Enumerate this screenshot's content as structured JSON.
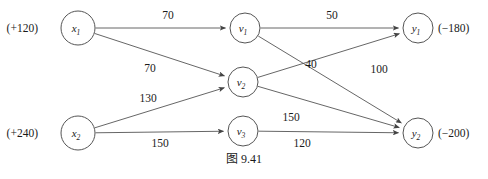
{
  "figure": {
    "caption": "图 9.41",
    "caption_x": 244,
    "caption_y": 163
  },
  "chart_data": {
    "type": "diagram",
    "title": "图 9.41",
    "nodes": [
      {
        "id": "x1",
        "label": "x",
        "sub": "1",
        "cx": 78,
        "cy": 28,
        "r": 17,
        "supply": "(+120)",
        "supply_x": 38,
        "supply_y": 32,
        "supply_align": "end"
      },
      {
        "id": "x2",
        "label": "x",
        "sub": "2",
        "cx": 78,
        "cy": 133,
        "r": 17,
        "supply": "(+240)",
        "supply_x": 38,
        "supply_y": 137,
        "supply_align": "end"
      },
      {
        "id": "v1",
        "label": "v",
        "sub": "1",
        "cx": 245,
        "cy": 28,
        "r": 15,
        "supply": "",
        "supply_x": 0,
        "supply_y": 0,
        "supply_align": "start"
      },
      {
        "id": "v2",
        "label": "v",
        "sub": "2",
        "cx": 243,
        "cy": 82,
        "r": 15,
        "supply": "",
        "supply_x": 0,
        "supply_y": 0,
        "supply_align": "start"
      },
      {
        "id": "v3",
        "label": "v",
        "sub": "3",
        "cx": 243,
        "cy": 131,
        "r": 15,
        "supply": "",
        "supply_x": 0,
        "supply_y": 0,
        "supply_align": "start"
      },
      {
        "id": "y1",
        "label": "y",
        "sub": "1",
        "cx": 418,
        "cy": 28,
        "r": 15,
        "supply": "(−180)",
        "supply_x": 438,
        "supply_y": 32,
        "supply_align": "start"
      },
      {
        "id": "y2",
        "label": "y",
        "sub": "2",
        "cx": 418,
        "cy": 133,
        "r": 15,
        "supply": "(−200)",
        "supply_x": 438,
        "supply_y": 137,
        "supply_align": "start"
      }
    ],
    "edges": [
      {
        "id": "x1-v1",
        "from": "x1",
        "to": "v1",
        "cost": "70",
        "label_x": 168,
        "label_y": 19
      },
      {
        "id": "x1-v2",
        "from": "x1",
        "to": "v2",
        "cost": "70",
        "label_x": 150,
        "label_y": 72
      },
      {
        "id": "x2-v2",
        "from": "x2",
        "to": "v2",
        "cost": "130",
        "label_x": 148,
        "label_y": 102
      },
      {
        "id": "x2-v3",
        "from": "x2",
        "to": "v3",
        "cost": "150",
        "label_x": 160,
        "label_y": 147
      },
      {
        "id": "v1-y1",
        "from": "v1",
        "to": "y1",
        "cost": "50",
        "label_x": 332,
        "label_y": 19
      },
      {
        "id": "v1-y2",
        "from": "v1",
        "to": "y2",
        "cost": "40",
        "label_x": 311,
        "label_y": 68
      },
      {
        "id": "v2-y1",
        "from": "v2",
        "to": "y1",
        "cost": "100",
        "label_x": 379,
        "label_y": 73
      },
      {
        "id": "v2-y2",
        "from": "v2",
        "to": "y2",
        "cost": "150",
        "label_x": 291,
        "label_y": 121
      },
      {
        "id": "v3-y2",
        "from": "v3",
        "to": "y2",
        "cost": "120",
        "label_x": 302,
        "label_y": 147
      }
    ]
  }
}
